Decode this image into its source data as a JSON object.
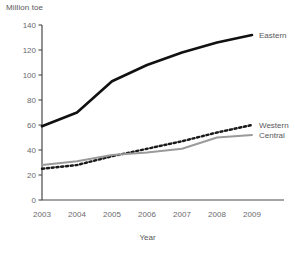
{
  "chart_data": {
    "type": "line",
    "title": "",
    "ylabel": "Million toe",
    "xlabel": "Year",
    "categories": [
      2003,
      2004,
      2005,
      2006,
      2007,
      2008,
      2009
    ],
    "x": [
      2003,
      2004,
      2005,
      2006,
      2007,
      2008,
      2009
    ],
    "ylim": [
      0,
      140
    ],
    "xlim": [
      2003,
      2009
    ],
    "yticks": [
      0,
      20,
      40,
      60,
      80,
      100,
      120,
      140
    ],
    "ytick_labels": [
      "0",
      "20",
      "40",
      "60",
      "80",
      "100",
      "120",
      "140"
    ],
    "xtick_labels": [
      "2003",
      "2004",
      "2005",
      "2006",
      "2007",
      "2008",
      "2009"
    ],
    "grid": false,
    "legend_position": "right-inline-labels",
    "series": [
      {
        "name": "Eastern",
        "label": "Eastern",
        "color": "#111111",
        "style": "solid-thick",
        "values": [
          59,
          70,
          95,
          108,
          118,
          126,
          132
        ]
      },
      {
        "name": "Western",
        "label": "Western",
        "color": "#1a1a1a",
        "style": "dotted-thick",
        "values": [
          25,
          28,
          35,
          41,
          47,
          54,
          60
        ]
      },
      {
        "name": "Central",
        "label": "Central",
        "color": "#9a9a9c",
        "style": "solid-gray",
        "values": [
          28,
          31,
          36,
          38,
          41,
          50,
          52
        ]
      }
    ]
  },
  "axis": {
    "y_title": "Million toe",
    "x_title": "Year"
  }
}
